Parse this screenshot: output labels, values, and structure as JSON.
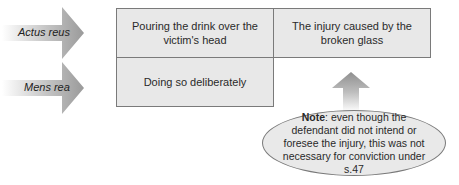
{
  "rows": [
    {
      "label": "Actus reus",
      "cells": [
        "Pouring the drink over the victim's head",
        "The injury caused by the broken glass"
      ]
    },
    {
      "label": "Mens rea",
      "cells": [
        "Doing so deliberately"
      ]
    }
  ],
  "note": {
    "bold": "Note",
    "text": ": even though the defendant did not intend or foresee the injury, this was not necessary for conviction under s.47"
  },
  "colors": {
    "cell_fill": "#e8e8e8",
    "border": "#7a7a7a",
    "arrow": "#9a9a9a"
  }
}
